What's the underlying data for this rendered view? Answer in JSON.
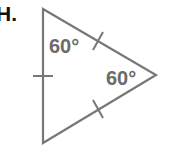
{
  "problem": {
    "label": "H."
  },
  "figure": {
    "shape": "triangle",
    "stroke_color": "#777777",
    "label_color": "#6b6b6b",
    "vertices": {
      "top": [
        43,
        9
      ],
      "right": [
        156,
        75
      ],
      "bottom": [
        43,
        143
      ]
    },
    "angles": [
      {
        "id": "top-angle",
        "text": "60°"
      },
      {
        "id": "right-angle",
        "text": "60°"
      }
    ],
    "congruence_marks": [
      {
        "side": "left",
        "count": 1
      },
      {
        "side": "upper",
        "count": 1
      },
      {
        "side": "lower",
        "count": 1
      }
    ]
  }
}
